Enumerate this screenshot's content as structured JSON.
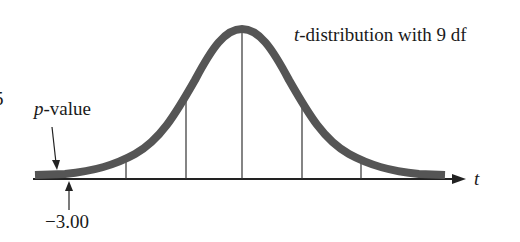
{
  "figure": {
    "curve_label_var": "t",
    "curve_label_rest": "-distribution with 9 df",
    "pvalue_var": "p",
    "pvalue_rest": "-value",
    "axis_label": "t",
    "tick_value": "−3.00",
    "left_edge_fragment": "5"
  },
  "colors": {
    "curve": "#555555",
    "lines": "#222222"
  }
}
